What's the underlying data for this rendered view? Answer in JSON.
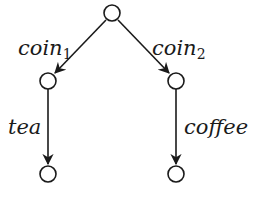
{
  "diagram": {
    "type": "transition-tree",
    "nodes": [
      {
        "id": "root",
        "cx": 112,
        "cy": 14
      },
      {
        "id": "left",
        "cx": 48,
        "cy": 81
      },
      {
        "id": "right",
        "cx": 176,
        "cy": 81
      },
      {
        "id": "left-leaf",
        "cx": 48,
        "cy": 174
      },
      {
        "id": "right-leaf",
        "cx": 176,
        "cy": 174
      }
    ],
    "edges": [
      {
        "from": "root",
        "to": "left",
        "label": "coin",
        "subscript": "1"
      },
      {
        "from": "root",
        "to": "right",
        "label": "coin",
        "subscript": "2"
      },
      {
        "from": "left",
        "to": "left-leaf",
        "label": "tea"
      },
      {
        "from": "right",
        "to": "right-leaf",
        "label": "coffee"
      }
    ],
    "labels": {
      "coin1": {
        "base": "coin",
        "sub": "1"
      },
      "coin2": {
        "base": "coin",
        "sub": "2"
      },
      "tea": "tea",
      "coffee": "coffee"
    },
    "colors": {
      "stroke": "#1a1a1a",
      "fill": "#ffffff"
    }
  }
}
